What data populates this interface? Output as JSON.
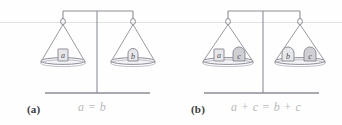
{
  "figure": {
    "type": "balance-scale-illustration",
    "panels": [
      {
        "id": "a",
        "caption": "(a)",
        "equation": "a = b",
        "left_pan_weights": [
          {
            "label": "a",
            "shape": "rectangular-block"
          }
        ],
        "right_pan_weights": [
          {
            "label": "b",
            "shape": "dome-block"
          }
        ]
      },
      {
        "id": "b",
        "caption": "(b)",
        "equation": "a + c = b + c",
        "left_pan_weights": [
          {
            "label": "a",
            "shape": "rectangular-block"
          },
          {
            "label": "c",
            "shape": "dome-block"
          }
        ],
        "right_pan_weights": [
          {
            "label": "b",
            "shape": "dome-block"
          },
          {
            "label": "c",
            "shape": "dome-block"
          }
        ]
      }
    ]
  },
  "colors": {
    "line": "#8d8d99",
    "line_light": "#b0b0bb",
    "weight_fill": "#e7e7ea",
    "weight_fill_dark": "#cfcfd4",
    "caption_text": "#3a3a3a",
    "equation_text": "#b9b9b9",
    "scan_rule": "#e2e2e2",
    "background": "#fefefe"
  },
  "labels": {
    "weight_a": "a",
    "weight_b": "b",
    "weight_c": "c"
  }
}
